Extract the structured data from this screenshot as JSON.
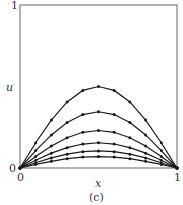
{
  "chart_data": {
    "type": "line",
    "title": "",
    "caption": "(c)",
    "xlabel": "x",
    "ylabel": "u",
    "xlim": [
      0,
      1
    ],
    "ylim": [
      0,
      1
    ],
    "x_ticks": [
      "0",
      "1"
    ],
    "y_ticks": [
      "0",
      "1"
    ],
    "grid": false,
    "legend": null,
    "markers": true,
    "x": [
      0,
      0.1,
      0.2,
      0.3,
      0.4,
      0.5,
      0.6,
      0.7,
      0.8,
      0.9,
      1.0
    ],
    "series": [
      {
        "name": "curve 1",
        "values": [
          0,
          0.155,
          0.294,
          0.405,
          0.476,
          0.5,
          0.476,
          0.405,
          0.294,
          0.155,
          0
        ]
      },
      {
        "name": "curve 2",
        "values": [
          0,
          0.107,
          0.203,
          0.279,
          0.328,
          0.345,
          0.328,
          0.279,
          0.203,
          0.107,
          0
        ]
      },
      {
        "name": "curve 3",
        "values": [
          0,
          0.071,
          0.135,
          0.186,
          0.219,
          0.23,
          0.219,
          0.186,
          0.135,
          0.071,
          0
        ]
      },
      {
        "name": "curve 4",
        "values": [
          0,
          0.048,
          0.091,
          0.125,
          0.147,
          0.155,
          0.147,
          0.125,
          0.091,
          0.048,
          0
        ]
      },
      {
        "name": "curve 5",
        "values": [
          0,
          0.032,
          0.062,
          0.085,
          0.1,
          0.105,
          0.1,
          0.085,
          0.062,
          0.032,
          0
        ]
      },
      {
        "name": "curve 6",
        "values": [
          0,
          0.022,
          0.041,
          0.057,
          0.067,
          0.07,
          0.067,
          0.057,
          0.041,
          0.022,
          0
        ]
      }
    ]
  },
  "colors": {
    "line": "#1a1a1a",
    "axis": "#555555"
  }
}
